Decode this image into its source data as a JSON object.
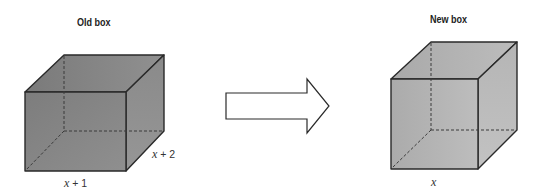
{
  "old_box": {
    "title": "Old box",
    "width_label_var": "x",
    "width_label_rest": " + 1",
    "depth_label_var": "x",
    "depth_label_rest": " + 2"
  },
  "new_box": {
    "title": "New box",
    "width_label_var": "x"
  },
  "arrow": {
    "direction": "right"
  },
  "colors": {
    "old_box_fill": "#8a8a8a",
    "new_box_fill": "#b3b3b3",
    "edge": "#2a2a2a"
  }
}
